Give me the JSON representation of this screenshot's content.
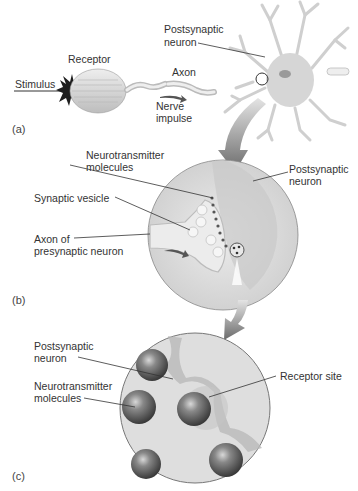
{
  "panels": {
    "a": {
      "tag": "(a)",
      "labels": {
        "receptor": "Receptor",
        "stimulus": "Stimulus",
        "axon": "Axon",
        "nerve_impulse_1": "Nerve",
        "nerve_impulse_2": "impulse",
        "postsynaptic_1": "Postsynaptic",
        "postsynaptic_2": "neuron"
      }
    },
    "b": {
      "tag": "(b)",
      "labels": {
        "neurotransmitter_1": "Neurotransmitter",
        "neurotransmitter_2": "molecules",
        "synaptic_vesicle": "Synaptic vesicle",
        "axon_of_1": "Axon of",
        "axon_of_2": "presynaptic neuron",
        "postsynaptic_1": "Postsynaptic",
        "postsynaptic_2": "neuron"
      }
    },
    "c": {
      "tag": "(c)",
      "labels": {
        "postsynaptic_1": "Postsynaptic",
        "postsynaptic_2": "neuron",
        "neurotransmitter_1": "Neurotransmitter",
        "neurotransmitter_2": "molecules",
        "receptor_site": "Receptor site"
      }
    }
  },
  "colors": {
    "line": "#333333",
    "circle_fill": "#dcdcdc",
    "sphere": "#6e6e6e",
    "arrow": "#7a7a7a"
  }
}
